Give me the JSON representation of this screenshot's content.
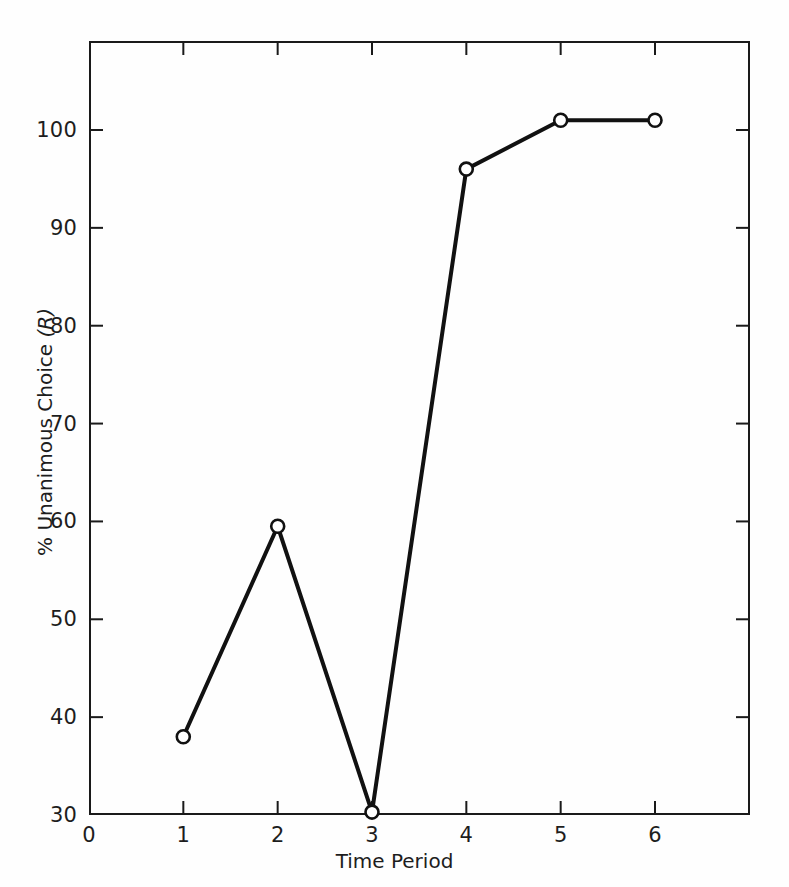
{
  "chart_data": {
    "type": "line",
    "title": "",
    "xlabel": "Time Period",
    "ylabel": "% Unanimous Choice (R)",
    "ylabel_plain": "% Unanimous Choice",
    "ylabel_italic_part": "(R)",
    "x": [
      1,
      2,
      3,
      4,
      5,
      6
    ],
    "values": [
      38,
      59.5,
      30.3,
      96,
      101,
      101
    ],
    "series": [
      {
        "name": "% Unanimous Choice (R)",
        "x": [
          1,
          2,
          3,
          4,
          5,
          6
        ],
        "values": [
          38,
          59.5,
          30.3,
          96,
          101,
          101
        ]
      }
    ],
    "xlim": [
      0,
      7
    ],
    "ylim": [
      30,
      109.2
    ],
    "xticks": [
      0,
      1,
      2,
      3,
      4,
      5,
      6
    ],
    "xtick_labels": [
      "0",
      "1",
      "2",
      "3",
      "4",
      "5",
      "6"
    ],
    "yticks": [
      30,
      40,
      50,
      60,
      70,
      80,
      90,
      100
    ],
    "ytick_labels": [
      "30",
      "40",
      "50",
      "60",
      "70",
      "80",
      "90",
      "100"
    ],
    "grid": false,
    "legend": false,
    "legend_position": "none",
    "marker": "open-circle",
    "line_color": "#111111",
    "marker_face_color": "#ffffff",
    "marker_edge_color": "#111111",
    "background_color": "#fefefe",
    "axis_color": "#1a1a1a",
    "tick_direction": "in",
    "frame_sides": [
      "left",
      "right",
      "top",
      "bottom"
    ]
  }
}
